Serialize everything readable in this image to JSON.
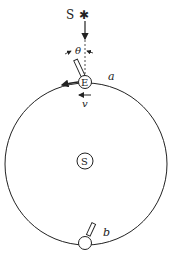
{
  "diagram": {
    "labels": {
      "star_label": "S",
      "star_glyph": "✱",
      "angle": "θ",
      "earth_top": "E",
      "sun": "S",
      "position_a": "a",
      "position_b": "b",
      "velocity": "v"
    },
    "colors": {
      "stroke": "#222222",
      "background": "#ffffff"
    }
  }
}
